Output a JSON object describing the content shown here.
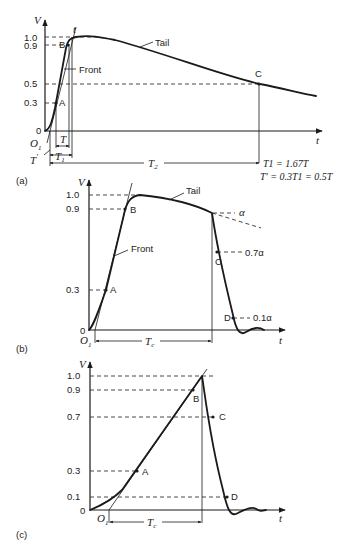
{
  "panels": [
    {
      "id": "a",
      "caption": "(a)",
      "axis_y": "V",
      "axis_x": "t",
      "peak_label": "t",
      "y_ticks": [
        "1.0",
        "0.9",
        "0.5",
        "0.3",
        "0"
      ],
      "points": [
        "A",
        "B",
        "C"
      ],
      "region_labels": {
        "front": "Front",
        "tail": "Tail"
      },
      "origin": "O",
      "origin_sub": "1",
      "intervals": {
        "T": "T",
        "T1": "T",
        "T1_sub": "1",
        "T2": "T",
        "T2_sub": "2",
        "Tprime": "T",
        "Tprime_sup": "′"
      },
      "formulas": [
        "T1 = 1.67T",
        "T′ = 0.3T1 = 0.5T"
      ]
    },
    {
      "id": "b",
      "caption": "(b)",
      "axis_y": "V",
      "axis_x": "t",
      "y_ticks": [
        "1.0",
        "0.9",
        "0.3",
        "0"
      ],
      "points": [
        "A",
        "B",
        "C",
        "D"
      ],
      "region_labels": {
        "front": "Front",
        "tail": "Tail"
      },
      "level_labels": [
        "α",
        "0.7α",
        "0.1α"
      ],
      "origin": "O",
      "origin_sub": "1",
      "interval": {
        "T": "T",
        "sub": "c"
      }
    },
    {
      "id": "c",
      "caption": "(c)",
      "axis_y": "V",
      "axis_x": "t",
      "y_ticks": [
        "1.0",
        "0.9",
        "0.7",
        "0.3",
        "0.1",
        "0"
      ],
      "points": [
        "A",
        "B",
        "C",
        "D"
      ],
      "origin": "O",
      "origin_sub": "1",
      "interval": {
        "T": "T",
        "sub": "c"
      }
    }
  ]
}
